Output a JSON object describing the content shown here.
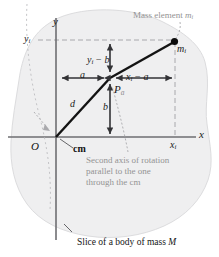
{
  "figure": {
    "background_color": "#ffffff",
    "body_fill_color": "#efeff0",
    "body_stroke_color": "#d8d8da",
    "gray_text_color": "#939393",
    "black_text_color": "#151515",
    "accent_line_color": "#111111",
    "dashed_line_color": "#a8a8ac"
  },
  "axes": {
    "y_label": "y",
    "x_label": "x",
    "origin_label": "O"
  },
  "points": {
    "cm_label": "cm",
    "second_axis_point_label": "P",
    "second_axis_point_sub": "a",
    "mass_element_point_label": "m",
    "mass_element_point_sub": "i"
  },
  "tick_labels": {
    "y_i": {
      "base": "y",
      "sub": "i"
    },
    "x_i": {
      "base": "x",
      "sub": "i"
    }
  },
  "dimensions": {
    "a": "a",
    "b": "b",
    "d": "d",
    "y_i_minus_b": {
      "base": "y",
      "sub": "i",
      "rest": "− b"
    },
    "x_i_minus_a": {
      "base": "x",
      "sub": "i",
      "rest": "− a"
    }
  },
  "annotations": {
    "mass_element": {
      "prefix": "Mass element ",
      "base": "m",
      "sub": "i"
    },
    "second_axis_line1": "Second axis of rotation",
    "second_axis_line2": "parallel to the one",
    "second_axis_line3": "through the cm",
    "slice_caption": {
      "prefix": "Slice of a body of mass ",
      "symbol": "M"
    }
  }
}
